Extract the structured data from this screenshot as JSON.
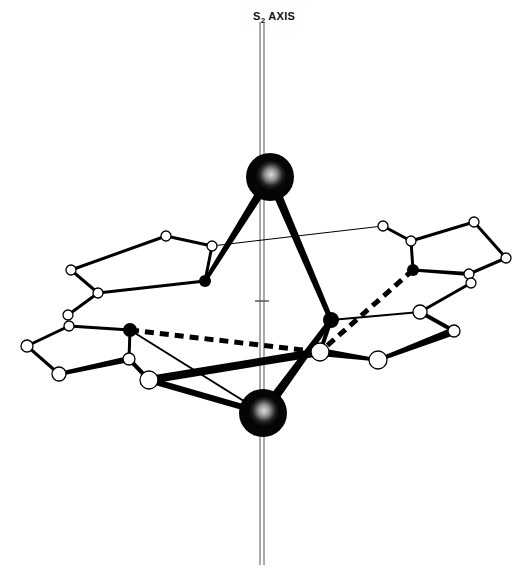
{
  "figure": {
    "title": "S2 AXIS",
    "axis_label_main": "S",
    "axis_label_sub": "2",
    "axis_label_suffix": " AXIS"
  },
  "colors": {
    "bond": "#000000",
    "atom_fill_open": "#ffffff",
    "atom_fill_solid": "#000000",
    "metal": "#111111",
    "axis": "#555555"
  },
  "atoms": {
    "metals": [
      {
        "id": "M1",
        "x": 270,
        "y": 177,
        "r": 24
      },
      {
        "id": "M2",
        "x": 263,
        "y": 413,
        "r": 24
      }
    ],
    "donors": [
      {
        "id": "N1",
        "x": 205,
        "y": 281,
        "r": 6
      },
      {
        "id": "N2",
        "x": 130,
        "y": 330,
        "r": 7
      },
      {
        "id": "N3",
        "x": 331,
        "y": 320,
        "r": 8
      },
      {
        "id": "N4",
        "x": 413,
        "y": 270,
        "r": 6
      }
    ],
    "open": [
      {
        "id": "C1",
        "x": 166,
        "y": 236,
        "r": 5
      },
      {
        "id": "C2",
        "x": 212,
        "y": 246,
        "r": 5
      },
      {
        "id": "C3",
        "x": 71,
        "y": 270,
        "r": 5
      },
      {
        "id": "C4",
        "x": 98,
        "y": 293,
        "r": 5
      },
      {
        "id": "C5",
        "x": 68,
        "y": 315,
        "r": 5
      },
      {
        "id": "C6",
        "x": 69,
        "y": 326,
        "r": 5
      },
      {
        "id": "C7",
        "x": 27,
        "y": 346,
        "r": 6
      },
      {
        "id": "C8",
        "x": 59,
        "y": 374,
        "r": 7
      },
      {
        "id": "C9",
        "x": 129,
        "y": 359,
        "r": 6
      },
      {
        "id": "C10",
        "x": 149,
        "y": 380,
        "r": 9
      },
      {
        "id": "C11",
        "x": 383,
        "y": 226,
        "r": 5
      },
      {
        "id": "C12",
        "x": 411,
        "y": 241,
        "r": 5
      },
      {
        "id": "C13",
        "x": 474,
        "y": 222,
        "r": 5
      },
      {
        "id": "C14",
        "x": 506,
        "y": 258,
        "r": 5
      },
      {
        "id": "C15",
        "x": 469,
        "y": 274,
        "r": 5
      },
      {
        "id": "C16",
        "x": 471,
        "y": 283,
        "r": 5
      },
      {
        "id": "C17",
        "x": 420,
        "y": 312,
        "r": 7
      },
      {
        "id": "C18",
        "x": 454,
        "y": 331,
        "r": 6
      },
      {
        "id": "C19",
        "x": 320,
        "y": 352,
        "r": 9
      },
      {
        "id": "C20",
        "x": 378,
        "y": 360,
        "r": 9
      }
    ]
  },
  "bonds": [
    {
      "a": "M1",
      "b": "N1",
      "w1": 9,
      "w2": 4
    },
    {
      "a": "M1",
      "b": "N3",
      "w1": 9,
      "w2": 5
    },
    {
      "a": "M2",
      "b": "C10",
      "w1": 6,
      "w2": 6,
      "tapered": false
    },
    {
      "a": "M2",
      "b": "N3",
      "w1": 10,
      "w2": 5
    },
    {
      "a": "M2",
      "b": "N2",
      "w1": 2,
      "w2": 2
    },
    {
      "a": "N1",
      "b": "C2",
      "w1": 3,
      "w2": 3
    },
    {
      "a": "N1",
      "b": "C4",
      "w1": 3,
      "w2": 3
    },
    {
      "a": "C1",
      "b": "C2",
      "w1": 3,
      "w2": 3
    },
    {
      "a": "C1",
      "b": "C3",
      "w1": 3,
      "w2": 3
    },
    {
      "a": "C3",
      "b": "C4",
      "w1": 3,
      "w2": 3
    },
    {
      "a": "C4",
      "b": "C5",
      "w1": 3,
      "w2": 3
    },
    {
      "a": "C6",
      "b": "N2",
      "w1": 3,
      "w2": 3
    },
    {
      "a": "C6",
      "b": "C7",
      "w1": 3,
      "w2": 3
    },
    {
      "a": "C7",
      "b": "C8",
      "w1": 3,
      "w2": 3
    },
    {
      "a": "C8",
      "b": "C9",
      "w1": 4,
      "w2": 6
    },
    {
      "a": "N2",
      "b": "C9",
      "w1": 3,
      "w2": 3
    },
    {
      "a": "C9",
      "b": "C10",
      "w1": 4,
      "w2": 4
    },
    {
      "a": "C10",
      "b": "C19",
      "w1": 8,
      "w2": 8
    },
    {
      "a": "C2",
      "b": "C11",
      "w1": 1,
      "w2": 1
    },
    {
      "a": "C11",
      "b": "C12",
      "w1": 3,
      "w2": 3
    },
    {
      "a": "C12",
      "b": "N4",
      "w1": 3,
      "w2": 3
    },
    {
      "a": "C12",
      "b": "C13",
      "w1": 3,
      "w2": 3
    },
    {
      "a": "C13",
      "b": "C14",
      "w1": 3,
      "w2": 3
    },
    {
      "a": "C14",
      "b": "C15",
      "w1": 3,
      "w2": 3
    },
    {
      "a": "N4",
      "b": "C15",
      "w1": 3,
      "w2": 4
    },
    {
      "a": "C16",
      "b": "C17",
      "w1": 3,
      "w2": 3
    },
    {
      "a": "C17",
      "b": "C18",
      "w1": 4,
      "w2": 4
    },
    {
      "a": "C18",
      "b": "C20",
      "w1": 8,
      "w2": 4
    },
    {
      "a": "N3",
      "b": "C17",
      "w1": 2,
      "w2": 2
    },
    {
      "a": "N3",
      "b": "C19",
      "w1": 4,
      "w2": 4
    },
    {
      "a": "C19",
      "b": "C20",
      "w1": 8,
      "w2": 3
    }
  ],
  "dashed_bonds": [
    {
      "a": "N2",
      "b": "C19",
      "w": 5
    },
    {
      "a": "N4",
      "b": "C19",
      "w": 5
    }
  ],
  "axis": {
    "x": 262,
    "y_top": 22,
    "y_bottom": 565,
    "center_tick_y": 301
  }
}
